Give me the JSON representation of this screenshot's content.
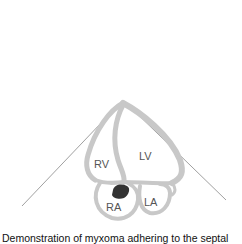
{
  "figure": {
    "labels": {
      "rv": "RV",
      "lv": "LV",
      "ra": "RA",
      "la": "LA"
    },
    "colors": {
      "wall": "#c8c8c8",
      "sector_line": "#888888",
      "mass": "#333333"
    }
  },
  "caption": "Demonstration of myxoma adhering to the septal"
}
